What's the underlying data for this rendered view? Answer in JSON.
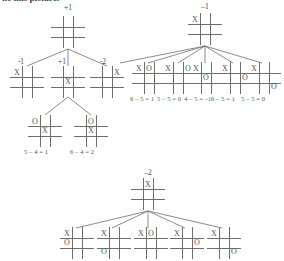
{
  "figure": {
    "type": "minimax-game-tree",
    "caption_partial": "he this picture.",
    "symbols": {
      "x": "X",
      "o": "O"
    }
  },
  "trees": [
    {
      "id": "tree-left",
      "root": {
        "value_label": "+1",
        "board": [
          "",
          "",
          "",
          "",
          "",
          "",
          "",
          "",
          ""
        ]
      },
      "children": [
        {
          "value_label": "-1",
          "board": [
            "X",
            "",
            "",
            "",
            "",
            "",
            "",
            "",
            ""
          ]
        },
        {
          "value_label": "+1",
          "board": [
            "",
            "",
            "",
            "",
            "X",
            "",
            "",
            "",
            ""
          ]
        },
        {
          "value_label": "-2",
          "board": [
            "",
            "",
            "X",
            "",
            "",
            "",
            "",
            "",
            ""
          ]
        }
      ],
      "grandchildren": [
        {
          "score": "5 – 4 = 1",
          "board": [
            "O",
            "",
            "",
            "",
            "X",
            "",
            "",
            "",
            ""
          ]
        },
        {
          "score": "6 – 4 = 2",
          "board": [
            "",
            "O",
            "",
            "",
            "X",
            "",
            "",
            "",
            ""
          ]
        }
      ]
    },
    {
      "id": "tree-right",
      "root": {
        "value_label": "–1",
        "board": [
          "X",
          "",
          "",
          "",
          "",
          "",
          "",
          "",
          ""
        ]
      },
      "children": [
        {
          "score": "6 – 5 = 1",
          "board": [
            "X",
            "O",
            "",
            "",
            "",
            "",
            "",
            "",
            ""
          ]
        },
        {
          "score": "5 – 5 = 0",
          "board": [
            "X",
            "",
            "O",
            "",
            "",
            "",
            "",
            "",
            ""
          ]
        },
        {
          "score": "4 – 5 = –1",
          "board": [
            "X",
            "",
            "",
            "",
            "O",
            "",
            "",
            "",
            ""
          ]
        },
        {
          "score": "6 – 5 = 1",
          "board": [
            "X",
            "",
            "",
            "",
            "",
            "O",
            "",
            "",
            ""
          ]
        },
        {
          "score": "5 – 5 = 0",
          "board": [
            "X",
            "",
            "",
            "",
            "",
            "",
            "",
            "",
            "O"
          ]
        }
      ]
    },
    {
      "id": "tree-bottom",
      "root": {
        "value_label": "–2",
        "board": [
          "",
          "X",
          "",
          "",
          "",
          "",
          "",
          "",
          ""
        ]
      },
      "children": [
        {
          "score": "",
          "board": [
            "X",
            "",
            "",
            "O",
            "",
            "",
            "",
            "",
            ""
          ]
        },
        {
          "score": "",
          "board": [
            "X",
            "",
            "",
            "",
            "",
            "",
            "O",
            "",
            ""
          ]
        },
        {
          "score": "",
          "board": [
            "X",
            "O",
            "",
            "",
            "",
            "",
            "",
            "",
            ""
          ]
        },
        {
          "score": "",
          "board": [
            "X",
            "",
            "",
            "",
            "",
            "O",
            "",
            "",
            ""
          ]
        },
        {
          "score": "",
          "board": [
            "X",
            "",
            "",
            "",
            "",
            "",
            "",
            "",
            "O"
          ]
        }
      ]
    }
  ]
}
